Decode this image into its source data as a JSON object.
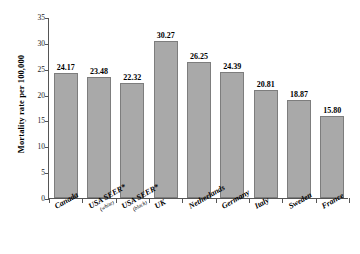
{
  "chart_data": {
    "type": "bar",
    "title": "",
    "xlabel": "",
    "ylabel": "Mortality rate per 100,000",
    "ylim": [
      0,
      35
    ],
    "ytick_step": 5,
    "yticks": [
      "0",
      "5",
      "10",
      "15",
      "20",
      "25",
      "30",
      "35"
    ],
    "grid": false,
    "legend": "none",
    "bar_color": "#a9a9a9",
    "bar_edge_color": "#7d7d7d",
    "categories": [
      "Canada",
      "USA SEER*",
      "USA SEER*",
      "UK",
      "Netherlands",
      "Germany",
      "Italy",
      "Sweden",
      "France"
    ],
    "category_sublabels": [
      "",
      "(white)",
      "(black)",
      "",
      "",
      "",
      "",
      "",
      ""
    ],
    "values": [
      24.17,
      23.48,
      22.32,
      30.27,
      26.25,
      24.39,
      20.81,
      18.87,
      15.8
    ],
    "value_labels": [
      "24.17",
      "23.48",
      "22.32",
      "30.27",
      "26.25",
      "24.39",
      "20.81",
      "18.87",
      "15.80"
    ]
  }
}
